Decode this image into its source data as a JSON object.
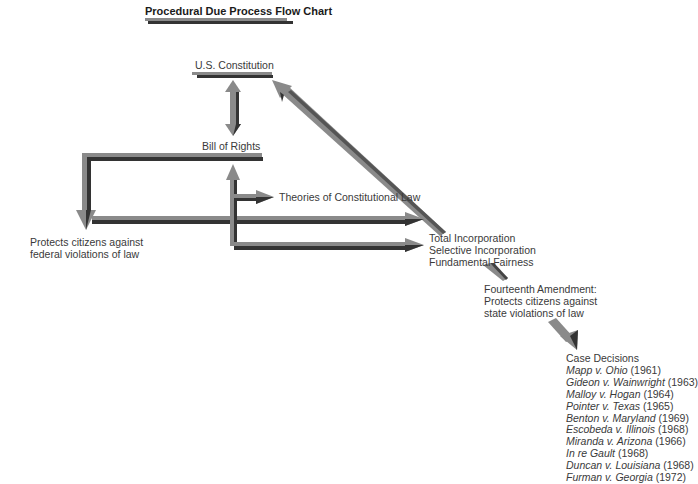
{
  "title": "Procedural Due Process Flow Chart",
  "nodes": {
    "constitution": "U.S. Constitution",
    "bill_of_rights": "Bill of Rights",
    "theories": "Theories of Constitutional Law",
    "federal_line1": "Protects citizens against",
    "federal_line2": "federal violations of law",
    "incorporation": [
      "Total Incorporation",
      "Selective Incorporation",
      "Fundamental Fairness"
    ],
    "fourteenth": [
      "Fourteenth Amendment:",
      "Protects citizens against",
      "state violations of law"
    ],
    "case_heading": "Case Decisions"
  },
  "cases": [
    {
      "name": "Mapp v. Ohio",
      "year": "(1961)"
    },
    {
      "name": "Gideon v. Wainwright",
      "year": "(1963)"
    },
    {
      "name": "Malloy v. Hogan",
      "year": "(1964)"
    },
    {
      "name": "Pointer v. Texas",
      "year": "(1965)"
    },
    {
      "name": "Benton v. Maryland",
      "year": "(1969)"
    },
    {
      "name": "Escobeda v. Illinois",
      "year": "(1968)"
    },
    {
      "name": "Miranda v. Arizona",
      "year": "(1966)"
    },
    {
      "name": "In re Gault",
      "year": "(1968)"
    },
    {
      "name": "Duncan v. Louisiana",
      "year": "(1968)"
    },
    {
      "name": "Furman v. Georgia",
      "year": "(1972)"
    }
  ],
  "colors": {
    "arrow_light": "#8a8a8a",
    "arrow_dark": "#333333",
    "text": "#3a3a3a"
  }
}
